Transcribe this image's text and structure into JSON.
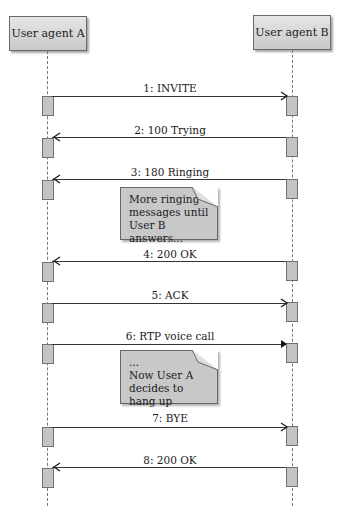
{
  "participants": [
    {
      "id": "a",
      "label": "User agent A"
    },
    {
      "id": "b",
      "label": "User agent B"
    }
  ],
  "messages": [
    {
      "label": "1: INVITE",
      "direction": "a-to-b",
      "arrowhead": "open"
    },
    {
      "label": "2: 100 Trying",
      "direction": "b-to-a",
      "arrowhead": "open"
    },
    {
      "label": "3: 180 Ringing",
      "direction": "b-to-a",
      "arrowhead": "open"
    },
    {
      "label": "4: 200 OK",
      "direction": "b-to-a",
      "arrowhead": "open"
    },
    {
      "label": "5: ACK",
      "direction": "a-to-b",
      "arrowhead": "open"
    },
    {
      "label": "6: RTP voice call",
      "direction": "a-to-b",
      "arrowhead": "filled"
    },
    {
      "label": "7: BYE",
      "direction": "a-to-b",
      "arrowhead": "open"
    },
    {
      "label": "8: 200 OK",
      "direction": "b-to-a",
      "arrowhead": "open"
    }
  ],
  "notes": [
    {
      "lines": [
        "More ringing",
        "messages until",
        "User B answers..."
      ]
    },
    {
      "lines": [
        "...",
        "Now User A",
        "decides to hang up"
      ]
    }
  ],
  "colors": {
    "header_fill": "#d6d6d6",
    "activation_fill": "#c4c4c4",
    "note_fill": "#c8c8c8",
    "line": "#333333"
  }
}
